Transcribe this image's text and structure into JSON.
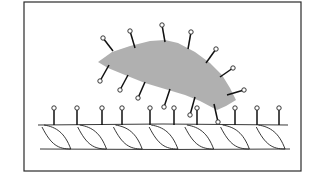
{
  "figure": {
    "type": "schematic illustration",
    "frame": {
      "x": 24,
      "y": 2,
      "width": 277,
      "height": 169
    },
    "colors": {
      "line": "#222222",
      "stipple": "#8a8a8a",
      "background": "#ffffff"
    }
  },
  "blob": {
    "label": "",
    "outline": [
      [
        98,
        62
      ],
      [
        112,
        52
      ],
      [
        130,
        46
      ],
      [
        150,
        41
      ],
      [
        165,
        40
      ],
      [
        178,
        43
      ],
      [
        195,
        52
      ],
      [
        210,
        63
      ],
      [
        222,
        75
      ],
      [
        230,
        88
      ],
      [
        236,
        100
      ],
      [
        226,
        106
      ],
      [
        217,
        110
      ],
      [
        200,
        101
      ],
      [
        185,
        95
      ],
      [
        165,
        89
      ],
      [
        145,
        83
      ],
      [
        125,
        75
      ],
      [
        108,
        68
      ]
    ],
    "projections": [
      {
        "from": [
          113,
          51
        ],
        "to": [
          103,
          38
        ]
      },
      {
        "from": [
          135,
          48
        ],
        "to": [
          130,
          31
        ]
      },
      {
        "from": [
          165,
          42
        ],
        "to": [
          162,
          25
        ]
      },
      {
        "from": [
          188,
          49
        ],
        "to": [
          191,
          32
        ]
      },
      {
        "from": [
          206,
          63
        ],
        "to": [
          216,
          49
        ]
      },
      {
        "from": [
          220,
          77
        ],
        "to": [
          233,
          68
        ]
      },
      {
        "from": [
          227,
          95
        ],
        "to": [
          244,
          90
        ]
      },
      {
        "from": [
          109,
          65
        ],
        "to": [
          100,
          81
        ]
      },
      {
        "from": [
          128,
          75
        ],
        "to": [
          120,
          90
        ]
      },
      {
        "from": [
          145,
          82
        ],
        "to": [
          138,
          98
        ]
      },
      {
        "from": [
          170,
          89
        ],
        "to": [
          164,
          107
        ]
      },
      {
        "from": [
          195,
          97
        ],
        "to": [
          190,
          115
        ]
      },
      {
        "from": [
          214,
          104
        ],
        "to": [
          218,
          122
        ]
      }
    ]
  },
  "strand": {
    "label": "",
    "top_y": 125,
    "bottom_y": 149,
    "x_start": 38,
    "x_end": 288,
    "twist_count": 7,
    "projections_x": [
      54,
      77,
      102,
      122,
      150,
      174,
      197,
      235,
      257,
      279
    ],
    "projection_top_y": 108
  }
}
